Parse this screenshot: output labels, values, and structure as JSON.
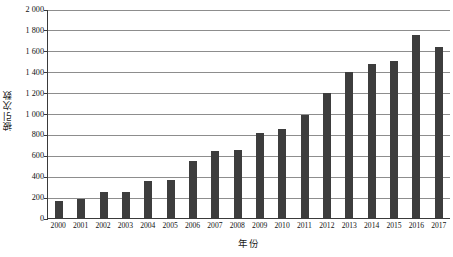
{
  "chart_data": {
    "type": "bar",
    "title": "",
    "subtitle": "",
    "xlabel": "年份",
    "ylabel": "被引次数",
    "categories": [
      "2000",
      "2001",
      "2002",
      "2003",
      "2004",
      "2005",
      "2006",
      "2007",
      "2008",
      "2009",
      "2010",
      "2011",
      "2012",
      "2013",
      "2014",
      "2015",
      "2016",
      "2017"
    ],
    "values": [
      165,
      180,
      250,
      250,
      350,
      360,
      545,
      640,
      650,
      815,
      855,
      985,
      1195,
      1395,
      1470,
      1505,
      1750,
      1640
    ],
    "series": [
      {
        "name": "被引次数",
        "values": [
          165,
          180,
          250,
          250,
          350,
          360,
          545,
          640,
          650,
          815,
          855,
          985,
          1195,
          1395,
          1470,
          1505,
          1750,
          1640
        ]
      }
    ],
    "ylim": [
      0,
      2000
    ],
    "ytick_values": [
      0,
      200,
      400,
      600,
      800,
      1000,
      1200,
      1400,
      1600,
      1800,
      2000
    ],
    "ytick_labels": [
      "0",
      "200",
      "400",
      "600",
      "800",
      "1 000",
      "1 200",
      "1 400",
      "1 600",
      "1 800",
      "2 000"
    ],
    "grid": true,
    "grid_axis": "y",
    "legend": false,
    "legend_position": "none",
    "bar_color": "#3d3d3d",
    "gridline_color": "#8d8d8d",
    "axis_color": "#3a3a3a",
    "background_color": "#ffffff"
  }
}
